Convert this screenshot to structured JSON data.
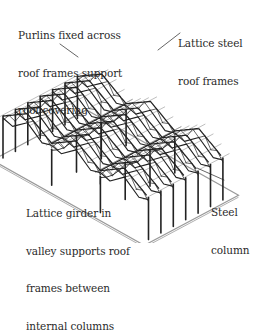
{
  "diagram": {
    "colors": {
      "ink": "#222222",
      "purlin": "#888888",
      "slab": "#9a9a9a",
      "background": "#ffffff"
    },
    "labels": {
      "purlins": {
        "lines": [
          "Purlins fixed across",
          "roof frames support",
          "roof covering"
        ]
      },
      "lattice_frames": {
        "lines": [
          "Lattice steel",
          "roof frames"
        ]
      },
      "valley_girder": {
        "lines": [
          "Lattice girder in",
          "valley supports roof",
          "frames between",
          "internal columns"
        ]
      },
      "steel_column": {
        "lines": [
          "Steel",
          "column"
        ]
      }
    }
  }
}
